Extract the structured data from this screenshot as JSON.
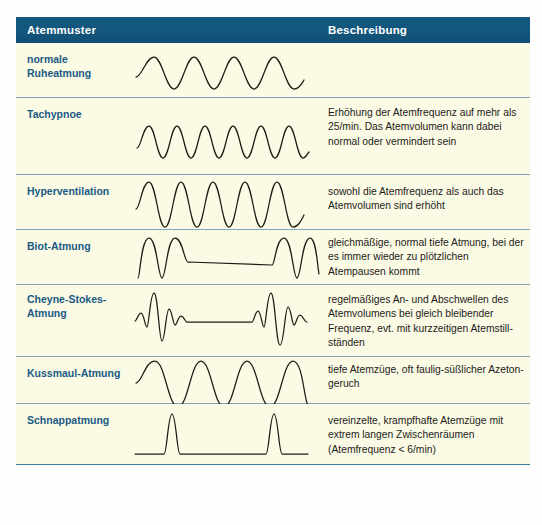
{
  "table": {
    "header": {
      "col_pattern": "Atemmuster",
      "col_description": "Beschreibung"
    },
    "header_bg": "#13567e",
    "row_bg": "#fbfae4",
    "label_color": "#1a5b84",
    "divider_color": "#7fa8bd",
    "rows": [
      {
        "name": "normale\nRuheatmung",
        "name_line1": "normale",
        "name_line2": "Ruheatmung",
        "waveform": "sine-regular-normal",
        "description": ""
      },
      {
        "name": "Tachypnoe",
        "waveform": "sine-fast-shallow",
        "description": "Erhöhung der Atemfrequenz auf mehr als 25/min. Das Atemvolumen kann dabei normal oder vermindert sein"
      },
      {
        "name": "Hyperventilation",
        "waveform": "sine-fast-deep",
        "description": "sowohl die Atemfrequenz als auch das Atemvolumen sind erhöht"
      },
      {
        "name": "Biot-Atmung",
        "waveform": "biot-pause",
        "description": "gleichmäßige, normal tiefe Atmung, bei der es immer wieder zu plötzlichen Atempausen kommt"
      },
      {
        "name": "Cheyne-Stokes-\nAtmung",
        "name_line1": "Cheyne-Stokes-",
        "name_line2": "Atmung",
        "waveform": "cheyne-stokes-crescendo",
        "description": "regelmäßiges An- und Abschwellen des Atemvolumens bei gleich bleibender Frequenz, evt. mit kurzzeitigen Atemstill-ständen"
      },
      {
        "name": "Kussmaul-Atmung",
        "waveform": "sine-deep-slow",
        "description": "tiefe Atemzüge, oft faulig-süßlicher Azeton-geruch"
      },
      {
        "name": "Schnappatmung",
        "waveform": "gasping-spikes",
        "description": "vereinzelte, krampfhafte Atemzüge mit extrem langen Zwischenräumen (Atemfrequenz < 6/min)"
      }
    ]
  }
}
